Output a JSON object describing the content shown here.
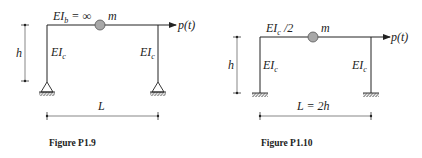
{
  "figures": [
    {
      "caption": "Figure P1.9",
      "beam_label_main": "EI",
      "beam_label_sub": "b",
      "beam_label_rest": " = ∞",
      "mass_label": "m",
      "load_label": "p(t)",
      "left_column_label_main": "EI",
      "left_column_label_sub": "c",
      "right_column_label_main": "EI",
      "right_column_label_sub": "c",
      "height_label": "h",
      "span_label": "L",
      "support_type": "pinned"
    },
    {
      "caption": "Figure P1.10",
      "beam_label_main": "EI",
      "beam_label_sub": "c",
      "beam_label_rest": " /2",
      "mass_label": "m",
      "load_label": "p(t)",
      "left_column_label_main": "EI",
      "left_column_label_sub": "c",
      "right_column_label_main": "EI",
      "right_column_label_sub": "c",
      "height_label": "h",
      "span_label": "L = 2h",
      "support_type": "fixed"
    }
  ],
  "colors": {
    "line": "#222222",
    "mass_fill": "#a8a8a8",
    "dim_line": "#444444"
  }
}
